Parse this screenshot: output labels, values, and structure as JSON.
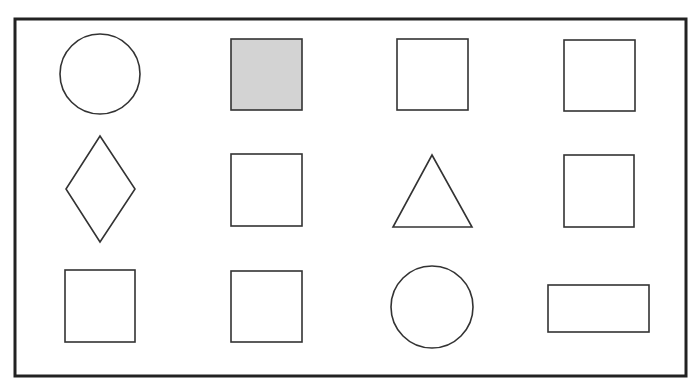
{
  "diagram": {
    "type": "shape-grid",
    "rows": 3,
    "columns": 4,
    "colors": {
      "background": "#ffffff",
      "frame_stroke": "#222222",
      "shape_stroke": "#333333",
      "highlight_fill": "#d3d3d3"
    },
    "frame": {
      "x": 15,
      "y": 19,
      "width": 671,
      "height": 357
    },
    "shapes": [
      {
        "row": 1,
        "col": 1,
        "kind": "circle",
        "filled": false,
        "cx": 100,
        "cy": 74,
        "r": 40
      },
      {
        "row": 1,
        "col": 2,
        "kind": "square",
        "filled": true,
        "x": 231,
        "y": 39,
        "w": 71,
        "h": 71
      },
      {
        "row": 1,
        "col": 3,
        "kind": "square",
        "filled": false,
        "x": 397,
        "y": 39,
        "w": 71,
        "h": 71
      },
      {
        "row": 1,
        "col": 4,
        "kind": "square",
        "filled": false,
        "x": 564,
        "y": 40,
        "w": 71,
        "h": 71
      },
      {
        "row": 2,
        "col": 1,
        "kind": "diamond",
        "filled": false,
        "points": "100,136 135,189 100,242 66,189"
      },
      {
        "row": 2,
        "col": 2,
        "kind": "square",
        "filled": false,
        "x": 231,
        "y": 154,
        "w": 71,
        "h": 72
      },
      {
        "row": 2,
        "col": 3,
        "kind": "triangle",
        "filled": false,
        "points": "432,155 472,227 393,227"
      },
      {
        "row": 2,
        "col": 4,
        "kind": "square",
        "filled": false,
        "x": 564,
        "y": 155,
        "w": 70,
        "h": 72
      },
      {
        "row": 3,
        "col": 1,
        "kind": "square",
        "filled": false,
        "x": 65,
        "y": 270,
        "w": 70,
        "h": 72
      },
      {
        "row": 3,
        "col": 2,
        "kind": "square",
        "filled": false,
        "x": 231,
        "y": 271,
        "w": 71,
        "h": 71
      },
      {
        "row": 3,
        "col": 3,
        "kind": "circle",
        "filled": false,
        "cx": 432,
        "cy": 307,
        "r": 41
      },
      {
        "row": 3,
        "col": 4,
        "kind": "rectangle",
        "filled": false,
        "x": 548,
        "y": 285,
        "w": 101,
        "h": 47
      }
    ]
  }
}
